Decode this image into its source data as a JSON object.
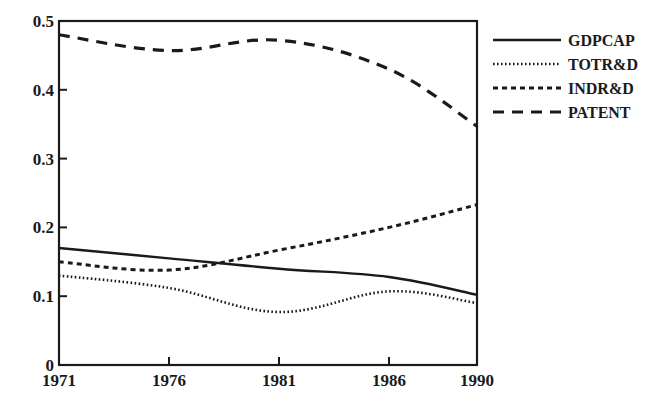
{
  "chart_data": {
    "type": "line",
    "title": "",
    "xlabel": "",
    "ylabel": "",
    "x": [
      1971,
      1976,
      1981,
      1986,
      1990
    ],
    "x_tick_labels": [
      "1971",
      "1976",
      "1981",
      "1986",
      "1990"
    ],
    "y_tick_labels": [
      "0",
      "0.1",
      "0.2",
      "0.3",
      "0.4",
      "0.5"
    ],
    "y_ticks": [
      0,
      0.1,
      0.2,
      0.3,
      0.4,
      0.5
    ],
    "ylim": [
      0,
      0.5
    ],
    "xlim": [
      1971,
      1990
    ],
    "grid": false,
    "legend_position": "right, outside plot, top",
    "series": [
      {
        "name": "GDPCAP",
        "style": "solid",
        "values": [
          0.17,
          0.155,
          0.14,
          0.128,
          0.102
        ]
      },
      {
        "name": "TOTR&D",
        "style": "dotted",
        "values": [
          0.13,
          0.112,
          0.077,
          0.107,
          0.09
        ]
      },
      {
        "name": "INDR&D",
        "style": "short-dashed",
        "values": [
          0.15,
          0.138,
          0.167,
          0.2,
          0.233
        ]
      },
      {
        "name": "PATENT",
        "style": "long-dashed",
        "values": [
          0.48,
          0.457,
          0.472,
          0.43,
          0.347
        ]
      }
    ]
  },
  "colors": {
    "line": "#1a1a1a",
    "background": "#ffffff"
  }
}
